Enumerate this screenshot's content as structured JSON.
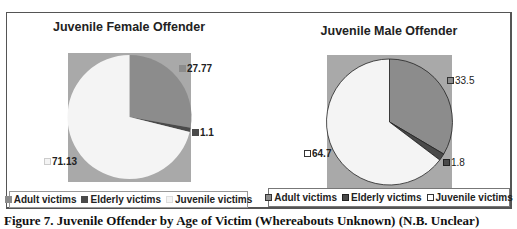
{
  "chart_data": [
    {
      "type": "pie",
      "title": "Juvenile Female Offender",
      "categories": [
        "Adult victims",
        "Elderly victims",
        "Juvenile victims"
      ],
      "values": [
        27.77,
        1.1,
        71.13
      ],
      "data_labels": [
        "27.77",
        "1.1",
        "71.13"
      ],
      "colors": [
        "#8c8c8c",
        "#4a4a4a",
        "#f4f4f4"
      ],
      "plot_background": "#a9a9a9",
      "legend_position": "bottom"
    },
    {
      "type": "pie",
      "title": "Juvenile Male Offender",
      "categories": [
        "Adult victims",
        "Elderly victims",
        "Juvenile victims"
      ],
      "values": [
        33.5,
        1.8,
        64.7
      ],
      "data_labels": [
        "33.5",
        "1.8",
        "64.7"
      ],
      "colors": [
        "#8c8c8c",
        "#4a4a4a",
        "#f4f4f4"
      ],
      "plot_background": "#a9a9a9",
      "legend_position": "bottom"
    }
  ],
  "charts": [
    {
      "title": "Juvenile Female Offender",
      "labels": {
        "adult": "27.77",
        "elderly": "1.1",
        "juvenile": "71.13"
      },
      "legend": [
        "Adult victims",
        "Elderly victims",
        "Juvenile victims"
      ]
    },
    {
      "title": "Juvenile Male Offender",
      "labels": {
        "adult": "33.5",
        "elderly": "1.8",
        "juvenile": "64.7"
      },
      "legend": [
        "Adult victims",
        "Elderly victims",
        "Juvenile victims"
      ]
    }
  ],
  "colors": {
    "adult": "#8c8c8c",
    "elderly": "#4a4a4a",
    "juvenile": "#f4f4f4",
    "plot_bg": "#a9a9a9"
  },
  "caption": "Figure 7. Juvenile Offender by Age of Victim (Whereabouts Unknown) (N.B. Unclear)"
}
